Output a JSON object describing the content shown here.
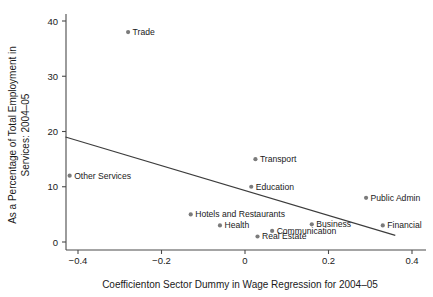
{
  "chart_data": {
    "type": "scatter",
    "title": "",
    "xlabel": "Coefficienton Sector Dummy in Wage Regression for 2004–05",
    "ylabel_line1": "As a Percentage of Total Employment in",
    "ylabel_line2": "Services: 2004–05",
    "xlim": [
      -0.46,
      0.42
    ],
    "ylim": [
      -1.2,
      41.5
    ],
    "grid": false,
    "legend": "none",
    "xticks": [
      -0.4,
      -0.2,
      0,
      0.2,
      0.4
    ],
    "xtick_labels": [
      "−0.4",
      "−0.2",
      "0",
      "0.2",
      "0.4"
    ],
    "yticks": [
      0,
      10,
      20,
      30,
      40
    ],
    "ytick_labels": [
      "0",
      "10",
      "20",
      "30",
      "40"
    ],
    "marker_color": "#7b7b7b",
    "line_color": "#3c3c3c",
    "axis_color": "#4a4a4a",
    "points": [
      {
        "label": "Trade",
        "x": -0.28,
        "y": 38,
        "anchor": "right"
      },
      {
        "label": "Other Services",
        "x": -0.42,
        "y": 12,
        "anchor": "right"
      },
      {
        "label": "Transport",
        "x": 0.025,
        "y": 15,
        "anchor": "right"
      },
      {
        "label": "Education",
        "x": 0.015,
        "y": 10,
        "anchor": "right"
      },
      {
        "label": "Public Admin",
        "x": 0.29,
        "y": 8,
        "anchor": "right"
      },
      {
        "label": "Hotels and Restaurants",
        "x": -0.13,
        "y": 5,
        "anchor": "right"
      },
      {
        "label": "Health",
        "x": -0.06,
        "y": 3,
        "anchor": "right"
      },
      {
        "label": "Business",
        "x": 0.16,
        "y": 3.2,
        "anchor": "right"
      },
      {
        "label": "Financial",
        "x": 0.33,
        "y": 3,
        "anchor": "right"
      },
      {
        "label": "Communication",
        "x": 0.065,
        "y": 2,
        "anchor": "right"
      },
      {
        "label": "Real Estate",
        "x": 0.03,
        "y": 1,
        "anchor": "right"
      }
    ],
    "fit_line": {
      "x1": -0.43,
      "y1": 19.0,
      "x2": 0.36,
      "y2": 1.2
    }
  }
}
